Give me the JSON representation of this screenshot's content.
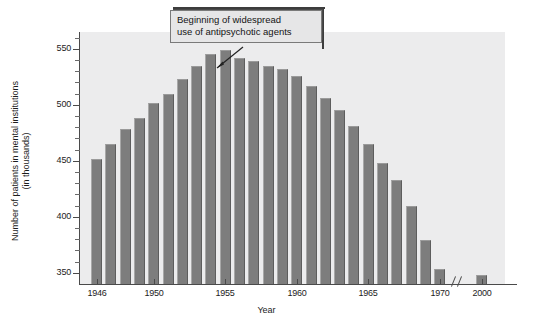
{
  "chart_data": {
    "type": "bar",
    "title": "",
    "xlabel": "Year",
    "ylabel": "Number of patients in mental institutions (in thousands)",
    "ylabel_line_1": "Number of patients in mental institutions",
    "ylabel_line_2": "(in thousands)",
    "ylim": [
      340,
      565
    ],
    "y_major_ticks": [
      350,
      400,
      450,
      500,
      550
    ],
    "y_minor_tick_step": 10,
    "grid": false,
    "legend": "none",
    "units": "thousands of patients",
    "axis_break_between": [
      1970,
      2000
    ],
    "x_tick_labels": [
      "1946",
      "1950",
      "1955",
      "1960",
      "1965",
      "1970",
      "2000"
    ],
    "categories": [
      1946,
      1947,
      1948,
      1949,
      1950,
      1951,
      1952,
      1953,
      1954,
      1955,
      1956,
      1957,
      1958,
      1959,
      1960,
      1961,
      1962,
      1963,
      1964,
      1965,
      1966,
      1967,
      1968,
      1969,
      1970,
      2000
    ],
    "values": [
      452,
      465,
      478,
      488,
      502,
      510,
      523,
      535,
      545,
      549,
      542,
      539,
      535,
      532,
      526,
      517,
      506,
      495,
      481,
      465,
      448,
      433,
      410,
      379,
      353,
      348
    ],
    "annotations": [
      {
        "text": "Beginning of widespread use of antipsychotic agents",
        "line_1": "Beginning of widespread",
        "line_2": "use of antipsychotic agents",
        "points_to_category": 1956
      }
    ],
    "colors": {
      "bar_fill": "#7d7d7d",
      "plot_background": "#ececed",
      "axis": "#4a4a4a",
      "callout_background": "#e6e6e7",
      "callout_border": "#7a7a7a",
      "text": "#1c1c1c"
    }
  }
}
